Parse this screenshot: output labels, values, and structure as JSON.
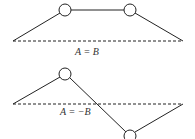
{
  "diagrams": [
    {
      "name": "symmetric-mode",
      "label": "A = B"
    },
    {
      "name": "antisymmetric-mode",
      "label": "A = −B"
    }
  ]
}
